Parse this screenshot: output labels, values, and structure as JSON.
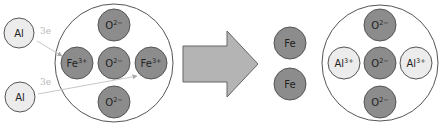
{
  "colors": {
    "background": "#ffffff",
    "dark_atom_fill": "#8c8c8c",
    "light_atom_fill": "#ececec",
    "atom_stroke": "#555555",
    "container_stroke": "#555555",
    "arrow_fill": "#b4b4b4",
    "arrow_stroke": "#666666",
    "electron_line": "#c8c8c8",
    "electron_label": "#b8b8b8"
  },
  "reactants": {
    "free_atoms": [
      {
        "symbol": "Al",
        "charge": "",
        "cx": 19,
        "cy": 33,
        "r": 15
      },
      {
        "symbol": "Al",
        "charge": "",
        "cx": 20,
        "cy": 97,
        "r": 15
      }
    ],
    "electron_transfers": [
      {
        "label": "3e",
        "x1": 37,
        "y1": 41,
        "x2": 62,
        "y2": 56,
        "label_x": 40,
        "label_y": 34
      },
      {
        "label": "3e",
        "x1": 38,
        "y1": 94,
        "x2": 137,
        "y2": 76,
        "label_x": 40,
        "label_y": 85
      }
    ],
    "compound": {
      "name": "iron-oxide",
      "cx": 114,
      "cy": 63,
      "r": 59,
      "ions": [
        {
          "symbol": "O",
          "charge": "2−",
          "cx": 114,
          "cy": 25,
          "r": 16,
          "type": "dark"
        },
        {
          "symbol": "Fe",
          "charge": "3+",
          "cx": 77,
          "cy": 63,
          "r": 16,
          "type": "dark"
        },
        {
          "symbol": "O",
          "charge": "2−",
          "cx": 114,
          "cy": 63,
          "r": 16,
          "type": "dark"
        },
        {
          "symbol": "Fe",
          "charge": "3+",
          "cx": 151,
          "cy": 63,
          "r": 16,
          "type": "dark"
        },
        {
          "symbol": "O",
          "charge": "2−",
          "cx": 114,
          "cy": 102,
          "r": 16,
          "type": "dark"
        }
      ]
    }
  },
  "reaction_arrow": {
    "points": "183,46 227,46 227,31 258,64 227,97 227,82 183,82"
  },
  "products": {
    "free_atoms": [
      {
        "symbol": "Fe",
        "charge": "",
        "cx": 290,
        "cy": 43,
        "r": 16
      },
      {
        "symbol": "Fe",
        "charge": "",
        "cx": 290,
        "cy": 84,
        "r": 16
      }
    ],
    "compound": {
      "name": "aluminium-oxide",
      "cx": 380,
      "cy": 63,
      "r": 58,
      "ions": [
        {
          "symbol": "O",
          "charge": "2−",
          "cx": 380,
          "cy": 25,
          "r": 16,
          "type": "dark"
        },
        {
          "symbol": "Al",
          "charge": "3+",
          "cx": 344,
          "cy": 63,
          "r": 16,
          "type": "light"
        },
        {
          "symbol": "O",
          "charge": "2−",
          "cx": 380,
          "cy": 63,
          "r": 16,
          "type": "dark"
        },
        {
          "symbol": "Al",
          "charge": "3+",
          "cx": 416,
          "cy": 63,
          "r": 16,
          "type": "light"
        },
        {
          "symbol": "O",
          "charge": "2−",
          "cx": 380,
          "cy": 102,
          "r": 16,
          "type": "dark"
        }
      ]
    }
  }
}
